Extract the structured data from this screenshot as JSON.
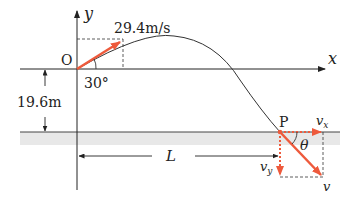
{
  "diagram": {
    "type": "projectile-motion",
    "axes": {
      "x_label": "x",
      "y_label": "y",
      "origin_label": "O"
    },
    "launch": {
      "speed_label": "29.4m/s",
      "angle_label": "30°"
    },
    "height": {
      "label": "19.6m"
    },
    "landing": {
      "point_label": "P",
      "distance_label": "L",
      "vx_label": "v",
      "vx_sub": "x",
      "vy_label": "v",
      "vy_sub": "y",
      "v_label": "v",
      "angle_label": "θ"
    },
    "colors": {
      "vector": "#ee5a3c",
      "line": "#222222",
      "ground": "#e6e6e6"
    }
  }
}
